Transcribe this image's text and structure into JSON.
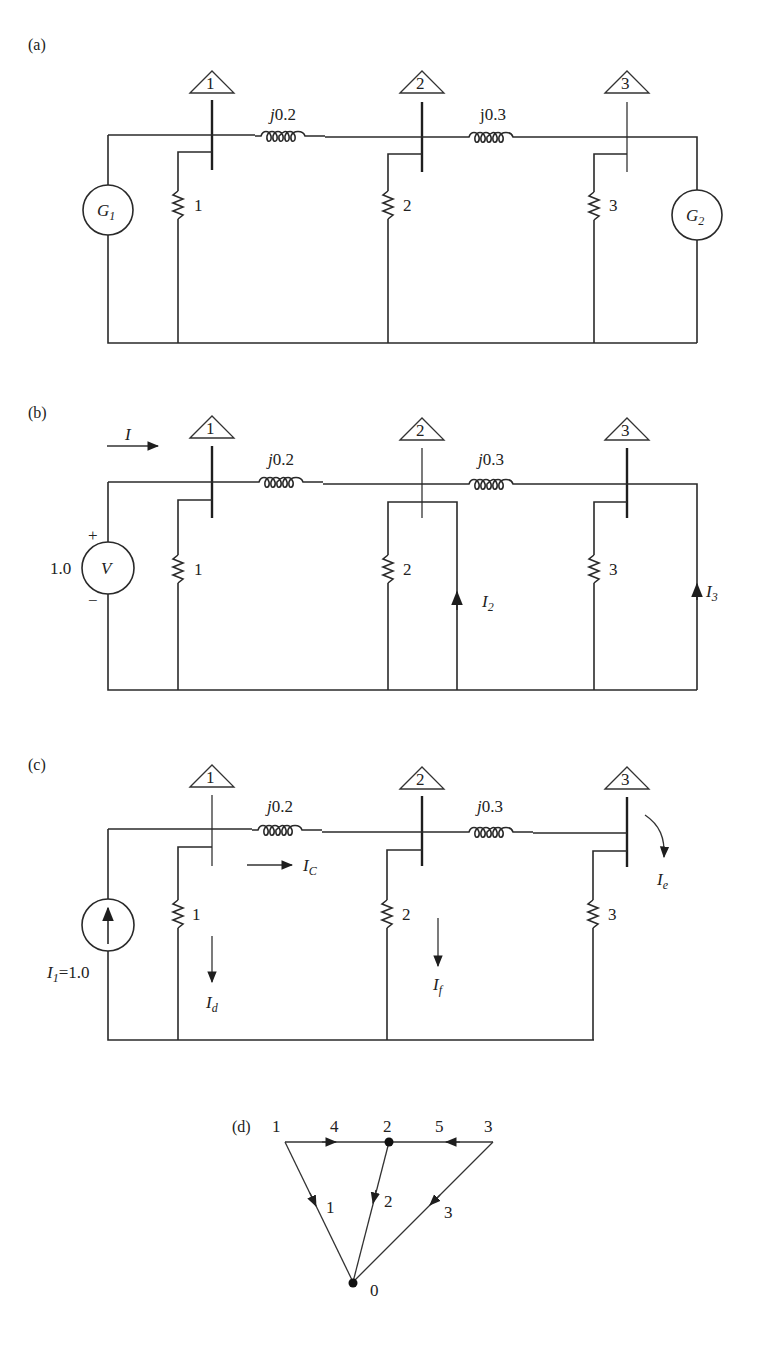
{
  "figure": {
    "panels": {
      "a": {
        "label": "(a)",
        "buses": [
          "1",
          "2",
          "3"
        ],
        "reactances": [
          "j0.2",
          "j0.3"
        ],
        "resistors": [
          "1",
          "2",
          "3"
        ],
        "generators": [
          {
            "symbol": "G",
            "sub": "1"
          },
          {
            "symbol": "G",
            "sub": "2"
          }
        ]
      },
      "b": {
        "label": "(b)",
        "buses": [
          "1",
          "2",
          "3"
        ],
        "reactances": [
          "j0.2",
          "j0.3"
        ],
        "resistors": [
          "1",
          "2",
          "3"
        ],
        "source": {
          "value": "1.0",
          "symbol": "V",
          "plus": "+",
          "minus": "−"
        },
        "currents": {
          "I": {
            "symbol": "I",
            "sub": ""
          },
          "I2": {
            "symbol": "I",
            "sub": "2"
          },
          "I3": {
            "symbol": "I",
            "sub": "3"
          }
        }
      },
      "c": {
        "label": "(c)",
        "buses": [
          "1",
          "2",
          "3"
        ],
        "reactances": [
          "j0.2",
          "j0.3"
        ],
        "resistors": [
          "1",
          "2",
          "3"
        ],
        "source": {
          "symbol": "I",
          "sub": "1",
          "value": "=1.0"
        },
        "currents": {
          "Ic": {
            "symbol": "I",
            "sub": "C"
          },
          "Id": {
            "symbol": "I",
            "sub": "d"
          },
          "If": {
            "symbol": "I",
            "sub": "f"
          },
          "Ie": {
            "symbol": "I",
            "sub": "e"
          }
        }
      },
      "d": {
        "label": "(d)",
        "nodes": [
          "1",
          "2",
          "3",
          "0"
        ],
        "edges": [
          {
            "id": "1",
            "from": "1",
            "to": "0"
          },
          {
            "id": "2",
            "from": "2",
            "to": "0"
          },
          {
            "id": "3",
            "from": "3",
            "to": "0"
          },
          {
            "id": "4",
            "from": "1",
            "to": "2"
          },
          {
            "id": "5",
            "from": "3",
            "to": "2"
          }
        ]
      }
    }
  }
}
